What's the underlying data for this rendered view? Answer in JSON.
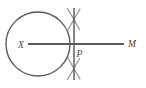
{
  "figure": {
    "background_color": "#ffffff",
    "stroke_color": "#565656",
    "line_color": "#5a5a5a",
    "arc_color": "#8b8b8b",
    "label_color": "#3d3d3d"
  },
  "labels": {
    "center": "X",
    "point_on_line": "P",
    "ray_end": "M"
  },
  "geometry": {
    "circle": {
      "center_x": 38,
      "center_y": 44,
      "radius": 32
    },
    "ray_XM": {
      "x1": 28,
      "y1": 44,
      "x2": 124,
      "y2": 44
    },
    "perpendicular_line": {
      "x": 74,
      "y_top": 8,
      "y_bottom": 80
    },
    "point_P": {
      "x": 74,
      "y": 44
    },
    "construction_arcs": [
      {
        "position": "upper",
        "cx": 74,
        "cy": 19
      },
      {
        "position": "lower",
        "cx": 74,
        "cy": 69
      }
    ]
  }
}
